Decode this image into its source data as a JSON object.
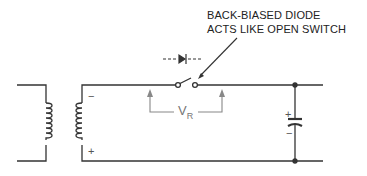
{
  "annotation": {
    "line1": "BACK-BIASED DIODE",
    "line2": "ACTS LIKE OPEN SWITCH"
  },
  "voltage_label": {
    "main": "V",
    "subscript": "R"
  },
  "polarity": {
    "secondary_top": "−",
    "secondary_bottom": "+",
    "capacitor_top": "+",
    "capacitor_bottom": "−"
  },
  "components": [
    "transformer",
    "diode-as-open-switch",
    "capacitor"
  ],
  "colors": {
    "wire": "#333333",
    "arrow": "#888888"
  }
}
